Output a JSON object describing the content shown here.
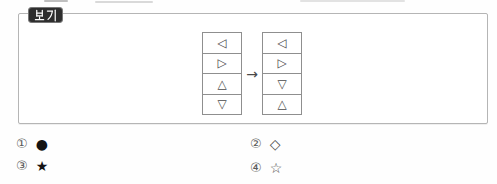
{
  "example_box": {
    "badge_label": "보기",
    "tables": {
      "left": [
        "◁",
        "▷",
        "△",
        "▽"
      ],
      "right": [
        "◁",
        "▷",
        "▽",
        "△"
      ]
    },
    "arrow": "→"
  },
  "options": [
    {
      "number": "①",
      "symbol": "●"
    },
    {
      "number": "②",
      "symbol": "◇"
    },
    {
      "number": "③",
      "symbol": "★"
    },
    {
      "number": "④",
      "symbol": "☆"
    }
  ],
  "colors": {
    "badge_bg": "#2e2e2e",
    "badge_text": "#ffffff",
    "box_border": "#b5b5b5",
    "table_border": "#8f8f8f",
    "glyph": "#4a4a4a",
    "option_number": "#5a5a5a",
    "filled": "#141414"
  }
}
